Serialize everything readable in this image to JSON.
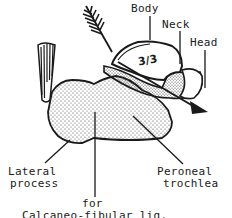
{
  "diagram": {
    "labels": {
      "body": "Body",
      "neck": "Neck",
      "head": "Head",
      "fraction": "3/3",
      "lateral_process_line1": "Lateral",
      "lateral_process_line2": "process",
      "peroneal_trochlea_line1": "Peroneal",
      "peroneal_trochlea_line2": "trochlea",
      "for_line": "for",
      "ligament_line": "Calcaneo-fibular lig."
    },
    "colors": {
      "ink": "#1a1a1a",
      "paper": "#ffffff",
      "stipple": "#3a3a3a"
    }
  }
}
